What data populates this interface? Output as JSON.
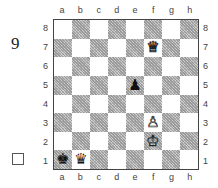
{
  "puzzle": {
    "number": "9"
  },
  "board": {
    "files": [
      "a",
      "b",
      "c",
      "d",
      "e",
      "f",
      "g",
      "h"
    ],
    "ranks": [
      "8",
      "7",
      "6",
      "5",
      "4",
      "3",
      "2",
      "1"
    ],
    "orientation": "white-bottom",
    "pieces": [
      {
        "square": "f7",
        "type": "queen",
        "color": "white",
        "glyph": "♕"
      },
      {
        "square": "e5",
        "type": "pawn",
        "color": "black",
        "glyph": "♟"
      },
      {
        "square": "f3",
        "type": "pawn",
        "color": "white",
        "glyph": "♙"
      },
      {
        "square": "f2",
        "type": "king",
        "color": "white",
        "glyph": "♔"
      },
      {
        "square": "a1",
        "type": "king",
        "color": "black",
        "glyph": "♚"
      },
      {
        "square": "b1",
        "type": "queen",
        "color": "black",
        "glyph": "♛"
      }
    ]
  },
  "to_move_checkbox": {
    "checked": false
  }
}
